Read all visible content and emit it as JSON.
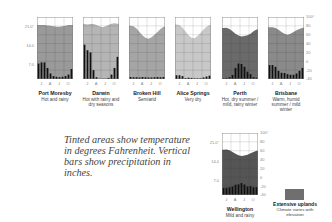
{
  "caption": "Tinted areas show temperature in degrees Fahrenheit. Vertical bars show precipitation in inches.",
  "axes": {
    "left_ticks": [
      "21.0\"",
      "14.0",
      "7.0"
    ],
    "right_ticks": [
      "100°",
      "80",
      "60",
      "40",
      "20",
      "0",
      "-20",
      "-40"
    ],
    "x_ticks": [
      "J",
      "A",
      "J",
      "O"
    ]
  },
  "legend": {
    "title": "Extensive uplands",
    "desc": "Climate varies with elevation",
    "color": "#6f6f6f"
  },
  "cities": [
    {
      "name": "Port Moresby",
      "desc": "Hot and rainy"
    },
    {
      "name": "Darwin",
      "desc": "Hot with rainy and dry seasons"
    },
    {
      "name": "Broken Hill",
      "desc": "Semiarid"
    },
    {
      "name": "Alice Springs",
      "desc": "Very dry"
    },
    {
      "name": "Perth",
      "desc": "Hot, dry summer / mild, rainy winter"
    },
    {
      "name": "Brisbane",
      "desc": "Warm, humid summer / mild winter"
    },
    {
      "name": "Wellington",
      "desc": "Mild and rainy"
    }
  ],
  "chart_data": [
    {
      "type": "bar+area",
      "title": "Port Moresby",
      "subtitle": "Hot and rainy",
      "categories": [
        "J",
        "F",
        "M",
        "A",
        "M",
        "J",
        "J",
        "A",
        "S",
        "O",
        "N",
        "D"
      ],
      "temp_f": [
        82,
        82,
        82,
        81,
        80,
        79,
        78,
        78,
        79,
        80,
        82,
        82
      ],
      "precip_in": [
        7.0,
        7.5,
        7.5,
        5.0,
        2.5,
        1.3,
        1.0,
        0.8,
        1.0,
        1.3,
        2.0,
        4.5
      ],
      "fill": "#9a9a9a",
      "y_left": [
        0,
        28
      ],
      "y_right": [
        -40,
        100
      ]
    },
    {
      "type": "bar+area",
      "title": "Darwin",
      "subtitle": "Hot with rainy and dry seasons",
      "categories": [
        "J",
        "F",
        "M",
        "A",
        "M",
        "J",
        "J",
        "A",
        "S",
        "O",
        "N",
        "D"
      ],
      "temp_f": [
        84,
        83,
        84,
        84,
        82,
        79,
        77,
        79,
        82,
        85,
        86,
        85
      ],
      "precip_in": [
        15.5,
        13.0,
        12.0,
        4.0,
        0.8,
        0.1,
        0.1,
        0.1,
        0.5,
        2.0,
        5.0,
        10.0
      ],
      "fill": "#b5b5b5",
      "y_left": [
        0,
        28
      ],
      "y_right": [
        -40,
        100
      ]
    },
    {
      "type": "bar+area",
      "title": "Broken Hill",
      "subtitle": "Semiarid",
      "categories": [
        "J",
        "F",
        "M",
        "A",
        "M",
        "J",
        "J",
        "A",
        "S",
        "O",
        "N",
        "D"
      ],
      "temp_f": [
        80,
        79,
        74,
        66,
        58,
        53,
        51,
        54,
        60,
        66,
        73,
        78
      ],
      "precip_in": [
        0.9,
        0.8,
        0.8,
        0.7,
        0.9,
        0.8,
        0.7,
        0.7,
        0.8,
        0.9,
        0.8,
        0.9
      ],
      "fill": "#a5a5a5",
      "y_left": [
        0,
        28
      ],
      "y_right": [
        -40,
        100
      ]
    },
    {
      "type": "bar+area",
      "title": "Alice Springs",
      "subtitle": "Very dry",
      "categories": [
        "J",
        "F",
        "M",
        "A",
        "M",
        "J",
        "J",
        "A",
        "S",
        "O",
        "N",
        "D"
      ],
      "temp_f": [
        83,
        82,
        76,
        67,
        59,
        53,
        52,
        57,
        64,
        72,
        78,
        82
      ],
      "precip_in": [
        1.7,
        1.7,
        1.3,
        0.4,
        0.6,
        0.5,
        0.3,
        0.3,
        0.3,
        0.7,
        1.1,
        1.5
      ],
      "fill": "#c8c8c8",
      "y_left": [
        0,
        28
      ],
      "y_right": [
        -40,
        100
      ]
    },
    {
      "type": "bar+area",
      "title": "Perth",
      "subtitle": "Hot, dry summer / mild, rainy winter",
      "categories": [
        "J",
        "F",
        "M",
        "A",
        "M",
        "J",
        "J",
        "A",
        "S",
        "O",
        "N",
        "D"
      ],
      "temp_f": [
        75,
        76,
        73,
        68,
        62,
        58,
        56,
        57,
        59,
        62,
        68,
        72
      ],
      "precip_in": [
        0.3,
        0.5,
        0.8,
        1.8,
        5.0,
        7.0,
        6.8,
        5.5,
        3.3,
        2.2,
        0.8,
        0.6
      ],
      "fill": "#6a6a6a",
      "y_left": [
        0,
        28
      ],
      "y_right": [
        -40,
        100
      ]
    },
    {
      "type": "bar+area",
      "title": "Brisbane",
      "subtitle": "Warm, humid summer / mild winter",
      "categories": [
        "J",
        "F",
        "M",
        "A",
        "M",
        "J",
        "J",
        "A",
        "S",
        "O",
        "N",
        "D"
      ],
      "temp_f": [
        77,
        77,
        75,
        71,
        66,
        62,
        60,
        62,
        66,
        70,
        73,
        76
      ],
      "precip_in": [
        6.3,
        6.3,
        5.5,
        3.7,
        2.8,
        2.7,
        2.2,
        1.9,
        1.9,
        2.5,
        3.7,
        5.0
      ],
      "fill": "#8a8a8a",
      "y_left": [
        0,
        28
      ],
      "y_right": [
        -40,
        100
      ]
    },
    {
      "type": "bar+area",
      "title": "Wellington",
      "subtitle": "Mild and rainy",
      "categories": [
        "J",
        "F",
        "M",
        "A",
        "M",
        "J",
        "J",
        "A",
        "S",
        "O",
        "N",
        "D"
      ],
      "temp_f": [
        62,
        63,
        61,
        57,
        53,
        50,
        48,
        49,
        51,
        54,
        57,
        60
      ],
      "precip_in": [
        3.2,
        3.2,
        3.5,
        3.8,
        4.6,
        4.8,
        5.4,
        4.7,
        3.8,
        4.0,
        3.5,
        3.5
      ],
      "fill": "#555555",
      "y_left": [
        0,
        28
      ],
      "y_right": [
        -40,
        100
      ]
    }
  ]
}
